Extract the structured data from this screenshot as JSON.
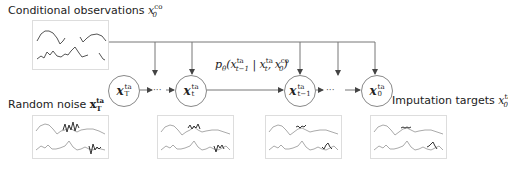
{
  "labels": {
    "conditional": "Conditional observations",
    "conditional_var": "x",
    "conditional_sup": "co",
    "conditional_sub": "0",
    "noise": "Random noise",
    "noise_var": "x",
    "noise_sup": "ta",
    "noise_sub": "T",
    "targets": "Imputation targets",
    "targets_var": "x",
    "targets_sup": "ta",
    "targets_sub": "0",
    "transition": "p",
    "transition_sub": "θ",
    "transition_args": "(x",
    "transition_a_sup": "ta",
    "transition_a_sub": "t−1",
    "transition_mid": " | x",
    "transition_b_sup": "ta",
    "transition_b_sub": "t",
    "transition_sep": ", x",
    "transition_c_sup": "co",
    "transition_c_sub": "0",
    "transition_end": ")"
  },
  "nodes": [
    {
      "var": "x",
      "sup": "ta",
      "sub": "T"
    },
    {
      "var": "x",
      "sup": "ta",
      "sub": "t"
    },
    {
      "var": "x",
      "sup": "ta",
      "sub": "t−1"
    },
    {
      "var": "x",
      "sup": "ta",
      "sub": "0"
    }
  ],
  "ellipsis": "···",
  "colors": {
    "line": "#666666",
    "series_light": "#aaaaaa",
    "series_dark": "#444444",
    "box_border": "#dddddd"
  }
}
